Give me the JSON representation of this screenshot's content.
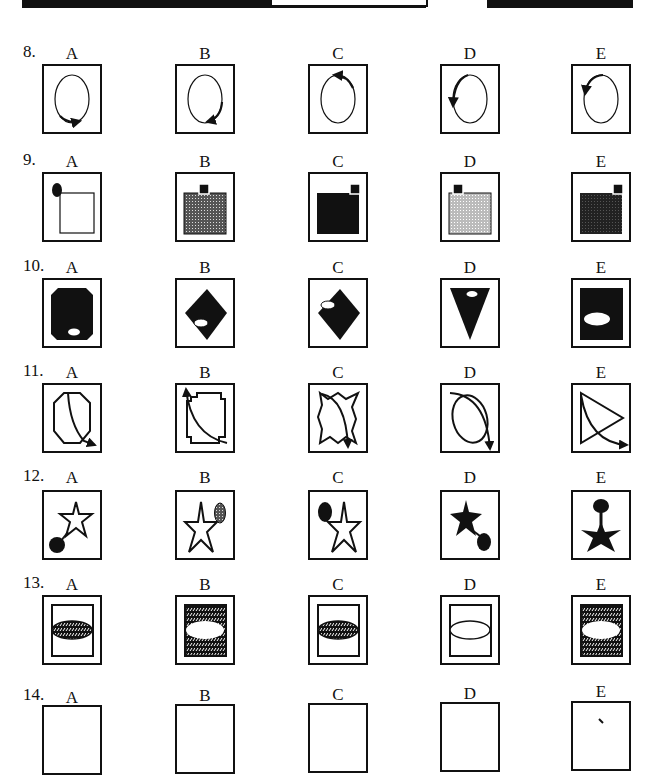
{
  "header": {
    "left_banner": "Non-Verbal Reasoning",
    "right_banner": "Paper"
  },
  "option_letters": [
    "A",
    "B",
    "C",
    "D",
    "E"
  ],
  "questions": [
    {
      "number": "8.",
      "options": [
        {
          "letter": "A",
          "figure": "oval with clockwise arrow at bottom-right pointing right"
        },
        {
          "letter": "B",
          "figure": "oval with arrow on right side pointing down-left at bottom"
        },
        {
          "letter": "C",
          "figure": "oval with arrow at top-right pointing left"
        },
        {
          "letter": "D",
          "figure": "oval with arrow on left side pointing down"
        },
        {
          "letter": "E",
          "figure": "oval with arrow at top-left pointing down"
        }
      ]
    },
    {
      "number": "9.",
      "options": [
        {
          "letter": "A",
          "figure": "white square with black oval at top-left corner"
        },
        {
          "letter": "B",
          "figure": "grey dotted square with small black square above centre"
        },
        {
          "letter": "C",
          "figure": "black square with small black square at top-right"
        },
        {
          "letter": "D",
          "figure": "light grey square with small black square at top-left"
        },
        {
          "letter": "E",
          "figure": "dark square with small black square at top-right"
        }
      ]
    },
    {
      "number": "10.",
      "options": [
        {
          "letter": "A",
          "figure": "black octagon with white oval at bottom"
        },
        {
          "letter": "B",
          "figure": "black diamond with white oval at lower-left"
        },
        {
          "letter": "C",
          "figure": "black diamond with white oval at upper-left"
        },
        {
          "letter": "D",
          "figure": "black inverted triangle with white oval at top"
        },
        {
          "letter": "E",
          "figure": "black rectangle with large white oval left of centre"
        }
      ]
    },
    {
      "number": "11.",
      "options": [
        {
          "letter": "A",
          "figure": "octagon with curved arrow to bottom-right"
        },
        {
          "letter": "B",
          "figure": "stepped square with curved arrow to top-left"
        },
        {
          "letter": "C",
          "figure": "jagged shape with curved arrow pointing down"
        },
        {
          "letter": "D",
          "figure": "oval with curved arrow pointing down"
        },
        {
          "letter": "E",
          "figure": "triangle with curved arrow to bottom-right"
        }
      ]
    },
    {
      "number": "12.",
      "options": [
        {
          "letter": "A",
          "figure": "white star with black circle at bottom-left"
        },
        {
          "letter": "B",
          "figure": "white star with grey oval at top-right"
        },
        {
          "letter": "C",
          "figure": "white star with black oval at top-left"
        },
        {
          "letter": "D",
          "figure": "black star with black oval at bottom-right"
        },
        {
          "letter": "E",
          "figure": "black star with black oval above"
        }
      ]
    },
    {
      "number": "13.",
      "options": [
        {
          "letter": "A",
          "figure": "rectangle with patterned oval band"
        },
        {
          "letter": "B",
          "figure": "patterned rectangle with white oval"
        },
        {
          "letter": "C",
          "figure": "rectangle with patterned oval band"
        },
        {
          "letter": "D",
          "figure": "rectangle with white oval"
        },
        {
          "letter": "E",
          "figure": "patterned rectangle with white oval"
        }
      ]
    },
    {
      "number": "14.",
      "options": [
        {
          "letter": "A",
          "figure": ""
        },
        {
          "letter": "B",
          "figure": ""
        },
        {
          "letter": "C",
          "figure": ""
        },
        {
          "letter": "D",
          "figure": ""
        },
        {
          "letter": "E",
          "figure": ""
        }
      ]
    }
  ]
}
